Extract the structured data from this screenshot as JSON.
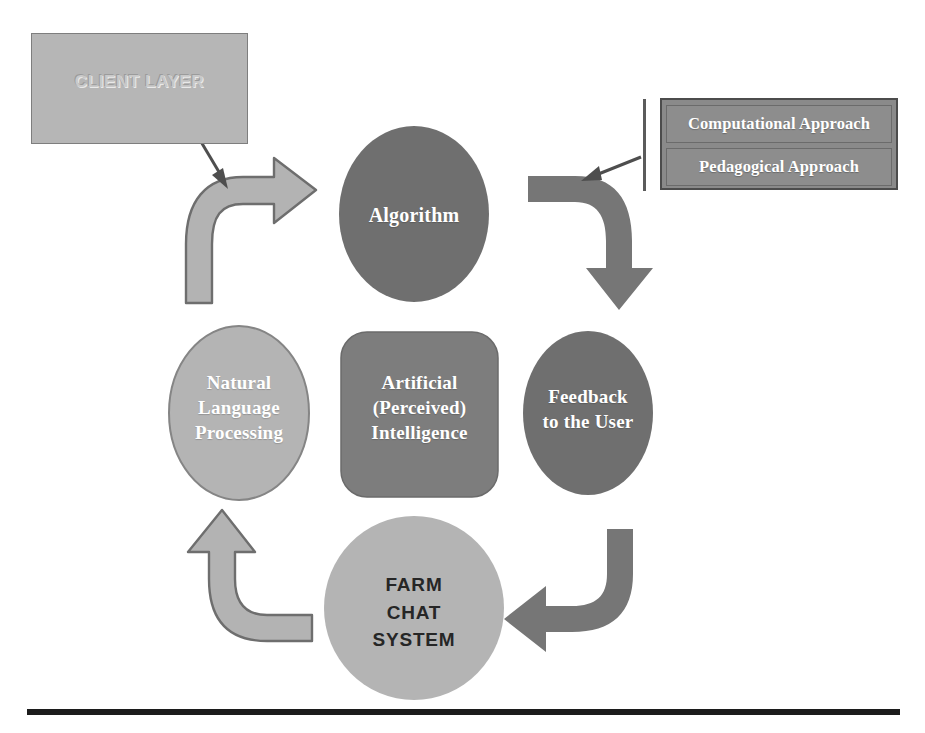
{
  "diagram": {
    "client_layer": {
      "label": "CLIENT LAYER"
    },
    "approaches": {
      "items": [
        {
          "label": "Computational Approach"
        },
        {
          "label": "Pedagogical Approach"
        }
      ]
    },
    "nodes": {
      "algorithm": {
        "label": "Algorithm"
      },
      "feedback": {
        "line1": "Feedback",
        "line2": "to the User"
      },
      "farm_chat": {
        "line1": "FARM",
        "line2": "CHAT",
        "line3": "SYSTEM"
      },
      "nlp": {
        "line1": "Natural",
        "line2": "Language",
        "line3": "Processing"
      },
      "ai_center": {
        "line1": "Artificial",
        "line2": "(Perceived)",
        "line3": "Intelligence"
      }
    },
    "colors": {
      "dark_node": "#6f6f6f",
      "mid_node": "#7d7d7d",
      "light_node": "#b4b4b4",
      "client_box": "#b6b6b6",
      "approach_box": "#8d8d8d",
      "arrow_dark": "#767676",
      "arrow_light": "#b3b3b3",
      "outline": "#6e6e6e",
      "rule": "#1c1c1c",
      "text_light": "#ffffff",
      "text_dark": "#262626"
    },
    "rule": {
      "x1": 27,
      "x2": 900,
      "y": 712
    }
  }
}
